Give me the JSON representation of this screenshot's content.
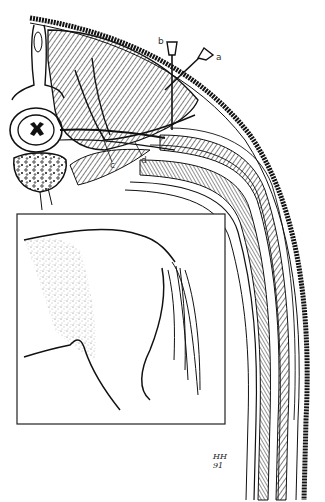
{
  "figure": {
    "labels": {
      "a": "a",
      "b": "b",
      "c": "c",
      "d": "d"
    },
    "signature": {
      "line1": "HH",
      "line2": "91"
    },
    "colors": {
      "ink": "#111111",
      "background": "#ffffff",
      "stipple": "#666666"
    }
  }
}
